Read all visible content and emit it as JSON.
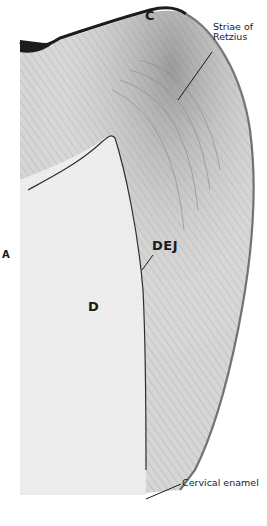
{
  "figure": {
    "panel_label": "A",
    "labels": {
      "cusp": "C",
      "striae": [
        "Striae of",
        "Retzius"
      ],
      "dej": "DEJ",
      "dentin": "D",
      "cervical": "Cervical enamel"
    },
    "colors": {
      "background": "#ffffff",
      "enamel": "#d9d9d9",
      "dentin": "#efefef",
      "dark_edge": "#2a2a2a",
      "label": "#1a1a1a"
    }
  }
}
